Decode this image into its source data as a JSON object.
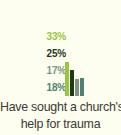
{
  "background_color": "#fdfdf0",
  "caption": {
    "line1": "Have sought a church's",
    "line2": "help for trauma",
    "color": "#3a3a34"
  },
  "chart_data": {
    "type": "bar",
    "title": "Have sought a church's help for trauma",
    "xlabel": "",
    "ylabel": "",
    "ylim": [
      0,
      40
    ],
    "grid": false,
    "legend": "none",
    "data_labels_position": "left-stacked",
    "categories": [
      "Series 1",
      "Series 2",
      "Series 3",
      "Series 4"
    ],
    "values": [
      33,
      25,
      17,
      18
    ],
    "labels": [
      "33%",
      "25%",
      "17%",
      "18%"
    ],
    "colors": [
      "#9ac63f",
      "#1d3a16",
      "#7f9480",
      "#4f8274"
    ]
  }
}
